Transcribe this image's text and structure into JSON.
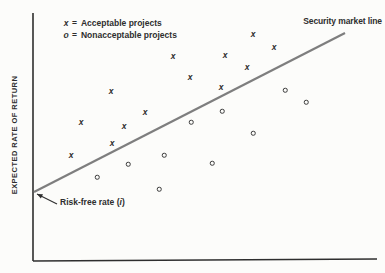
{
  "figure": {
    "legend_eq": "=",
    "risk_free": {
      "pre": "Risk-free rate (",
      "i": "i",
      "post": ")"
    }
  },
  "chart_data": {
    "type": "scatter",
    "title": "",
    "xlabel": "",
    "ylabel": "EXPECTED RATE OF RETURN",
    "grid": false,
    "ticks": false,
    "coordinate_units": "pixels on 385x273 canvas, y increases downward",
    "colors": {
      "axis": "#2e2e2e",
      "sml": "#7e7e7e",
      "marker": "#2e2e2e"
    },
    "axes": {
      "y_axis_px": [
        [
          33,
          13
        ],
        [
          33,
          261
        ]
      ],
      "x_axis_px": [
        [
          33,
          261
        ],
        [
          377,
          259
        ]
      ]
    },
    "series": [
      {
        "name": "Acceptable projects",
        "marker": "x",
        "points_px": [
          [
            253,
            35
          ],
          [
            274,
            48
          ],
          [
            225,
            56
          ],
          [
            173,
            57
          ],
          [
            247,
            68
          ],
          [
            190,
            78
          ],
          [
            221,
            88
          ],
          [
            111,
            92
          ],
          [
            145,
            113
          ],
          [
            81,
            123
          ],
          [
            124,
            127
          ],
          [
            112,
            144
          ],
          [
            71,
            156
          ]
        ]
      },
      {
        "name": "Nonacceptable projects",
        "marker": "o",
        "points_px": [
          [
            285,
            90
          ],
          [
            306,
            102
          ],
          [
            222,
            111
          ],
          [
            191,
            122
          ],
          [
            253,
            133
          ],
          [
            164,
            155
          ],
          [
            212,
            163
          ],
          [
            128,
            164
          ],
          [
            97,
            177
          ],
          [
            159,
            189
          ]
        ]
      }
    ],
    "line": {
      "name": "Security market line",
      "from_px": [
        34,
        192
      ],
      "to_px": [
        345,
        33
      ]
    },
    "annotations": [
      {
        "text": "Risk-free rate (i)",
        "points_to": "y-intercept of security market line",
        "tail_px": [
          57,
          204
        ],
        "tip_px": [
          37,
          194
        ]
      }
    ]
  }
}
